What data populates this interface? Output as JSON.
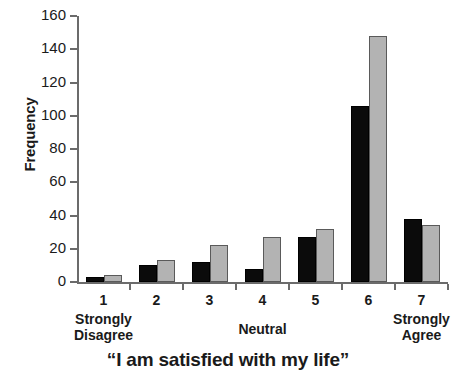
{
  "chart_data": {
    "type": "bar",
    "title": "",
    "xlabel": "“I am satisfied with my life”",
    "ylabel": "Frequency",
    "categories": [
      "1",
      "2",
      "3",
      "4",
      "5",
      "6",
      "7"
    ],
    "category_anchors": [
      {
        "position": "1",
        "lines": [
          "Strongly",
          "Disagree"
        ]
      },
      {
        "position": "4",
        "lines": [
          "Neutral"
        ]
      },
      {
        "position": "7",
        "lines": [
          "Strongly",
          "Agree"
        ]
      }
    ],
    "series": [
      {
        "name": "series-dark",
        "color": "#0b0b0b",
        "values": [
          3,
          10,
          12,
          8,
          27,
          106,
          38
        ]
      },
      {
        "name": "series-light",
        "color": "#b3b3b3",
        "values": [
          4,
          13,
          22,
          27,
          32,
          148,
          34
        ]
      }
    ],
    "ylim": [
      0,
      160
    ],
    "yticks": [
      0,
      20,
      40,
      60,
      80,
      100,
      120,
      140,
      160
    ],
    "ytick_labels": [
      "0",
      "20",
      "40",
      "60",
      "80",
      "100",
      "120",
      "140",
      "160"
    ],
    "grid": false,
    "legend": "none",
    "axis_color": "#6b6b6b"
  }
}
